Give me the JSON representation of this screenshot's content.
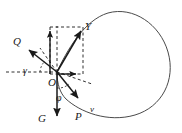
{
  "figure": {
    "background_color": "#ffffff",
    "stroke_color": "#1a1a1a",
    "origin": {
      "label": "O",
      "x": 57,
      "y": 72
    },
    "vectors": [
      {
        "name": "Y",
        "label": "Y",
        "direction": "up-right",
        "tip_x": 83,
        "tip_y": 28,
        "label_x": 86,
        "label_y": 28
      },
      {
        "name": "Q",
        "label": "Q",
        "direction": "up-left",
        "tip_x": 26,
        "tip_y": 47,
        "label_x": 17,
        "label_y": 42
      },
      {
        "name": "G",
        "label": "G",
        "direction": "down",
        "tip_x": 57,
        "tip_y": 120,
        "label_x": 41,
        "label_y": 118
      },
      {
        "name": "P",
        "label": "P",
        "direction": "down-right",
        "tip_x": 81,
        "tip_y": 100,
        "label_x": 79,
        "label_y": 116
      },
      {
        "name": "v",
        "label": "v",
        "direction": "down-right-tangent",
        "label_x": 90,
        "label_y": 109
      }
    ],
    "component_vectors": [
      {
        "name": "Y-vertical-component",
        "direction": "up",
        "tip_x": 50,
        "tip_y": 29
      },
      {
        "name": "Y-horizontal-component",
        "direction": "right",
        "tip_x": 70,
        "tip_y": 75
      }
    ],
    "angles": [
      {
        "name": "gamma",
        "label": "γ",
        "label_x": 25,
        "label_y": 71
      },
      {
        "name": "phi",
        "label": "φ",
        "label_x": 58,
        "label_y": 97
      }
    ],
    "dashed_elements": [
      "horizontal-axis-left",
      "vertical-guide",
      "component-rectangle",
      "tangent-guide",
      "angle-ray"
    ],
    "curve": {
      "name": "trajectory-loop",
      "type": "closed-oval",
      "stroke": "#4a4a4a"
    }
  }
}
